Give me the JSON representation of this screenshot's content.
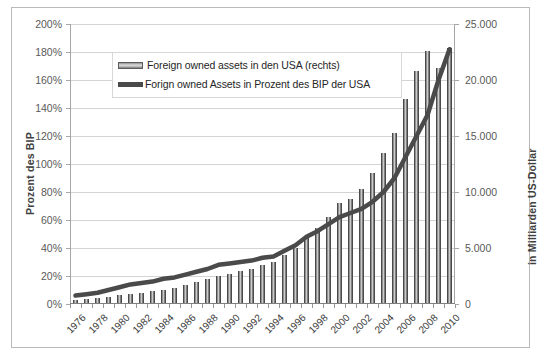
{
  "chart_data": {
    "type": "bar",
    "title": "",
    "subtitle": "",
    "xlabel": "",
    "ylabel": "Prozent des BIP",
    "y2label": "in Milliarden US-Dollar",
    "grid": true,
    "legend_position": "inside-top-left",
    "ylim": [
      0,
      200
    ],
    "y2lim": [
      0,
      25000
    ],
    "yticks": [
      "0%",
      "20%",
      "40%",
      "60%",
      "80%",
      "100%",
      "120%",
      "140%",
      "160%",
      "180%",
      "200%"
    ],
    "ytick_values": [
      0,
      20,
      40,
      60,
      80,
      100,
      120,
      140,
      160,
      180,
      200
    ],
    "y2ticks": [
      "0",
      "5.000",
      "10.000",
      "15.000",
      "20.000",
      "25.000"
    ],
    "y2tick_values": [
      0,
      5000,
      10000,
      15000,
      20000,
      25000
    ],
    "x": [
      1976,
      1977,
      1978,
      1979,
      1980,
      1981,
      1982,
      1983,
      1984,
      1985,
      1986,
      1987,
      1988,
      1989,
      1990,
      1991,
      1992,
      1993,
      1994,
      1995,
      1996,
      1997,
      1998,
      1999,
      2000,
      2001,
      2002,
      2003,
      2004,
      2005,
      2006,
      2007,
      2008,
      2009,
      2010
    ],
    "xtick_labels": [
      "1976",
      "1978",
      "1980",
      "1982",
      "1984",
      "1986",
      "1988",
      "1990",
      "1992",
      "1994",
      "1996",
      "1998",
      "2000",
      "2002",
      "2004",
      "2006",
      "2008",
      "2010"
    ],
    "series": [
      {
        "name": "Foreign owned assets in den USA (rechts)",
        "type": "bar",
        "axis": "right",
        "unit": "Milliarden US-Dollar",
        "values": [
          300,
          360,
          450,
          560,
          700,
          820,
          930,
          1040,
          1200,
          1360,
          1600,
          1850,
          2100,
          2400,
          2600,
          2850,
          3080,
          3400,
          3650,
          4300,
          4900,
          5900,
          6700,
          7700,
          8900,
          9300,
          10200,
          11600,
          13400,
          15200,
          18200,
          20700,
          22500,
          21000,
          22800
        ]
      },
      {
        "name": "Forign owned Assets in Prozent des BIP der USA",
        "type": "line",
        "axis": "left",
        "unit": "Prozent des BIP",
        "values": [
          6,
          7,
          8,
          10,
          12,
          14,
          15,
          16,
          18,
          19,
          21,
          23,
          25,
          28,
          29,
          30,
          31,
          33,
          34,
          38,
          42,
          48,
          52,
          57,
          62,
          65,
          68,
          73,
          80,
          90,
          105,
          120,
          135,
          160,
          182
        ]
      }
    ]
  }
}
